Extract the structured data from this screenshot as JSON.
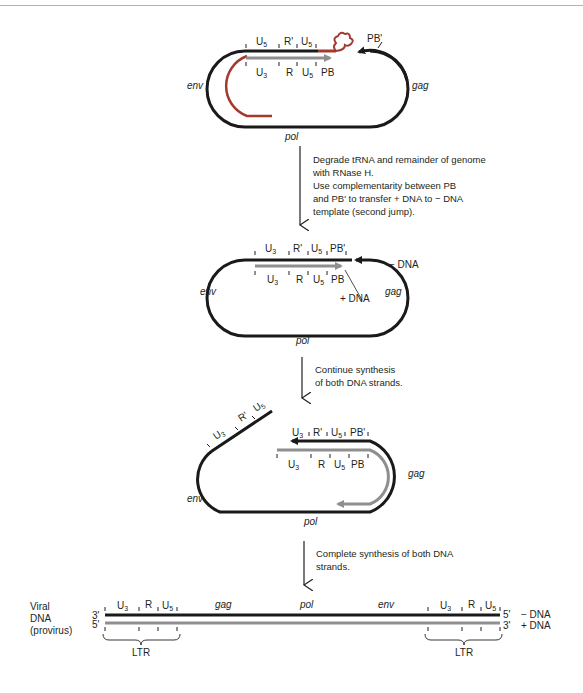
{
  "figure": {
    "colors": {
      "minus_dna": "#1a1a1a",
      "plus_dna": "#8f8f8f",
      "rna_trna": "#a33a2e",
      "header_rule": "#c9a9ae"
    },
    "panel1": {
      "top_labels": [
        "U",
        "R'",
        "U"
      ],
      "top_subs": [
        "5",
        "",
        "5"
      ],
      "bottom_labels": [
        "U",
        "R",
        "U",
        "PB"
      ],
      "bottom_subs": [
        "3",
        "",
        "5",
        ""
      ],
      "pb_prime": "PB'",
      "env": "env",
      "gag": "gag",
      "pol": "pol"
    },
    "step1": {
      "lines": [
        "Degrade tRNA and remainder of genome",
        "with RNase H.",
        "Use complementarity between PB",
        "and PB' to transfer  + DNA to  − DNA",
        "template (second jump)."
      ]
    },
    "panel2": {
      "top_labels": [
        "U",
        "R'",
        "U",
        "PB'"
      ],
      "top_subs": [
        "3",
        "",
        "5",
        ""
      ],
      "bottom_labels": [
        "U",
        "R",
        "U",
        "PB"
      ],
      "bottom_subs": [
        "3",
        "",
        "5",
        ""
      ],
      "minus_dna": "− DNA",
      "plus_dna": "+ DNA",
      "env": "env",
      "gag": "gag",
      "pol": "pol"
    },
    "step2": {
      "lines": [
        "Continue synthesis",
        "of both DNA strands."
      ]
    },
    "panel3": {
      "diag_labels": [
        "U",
        "R'",
        "U"
      ],
      "diag_subs": [
        "3",
        "",
        "5"
      ],
      "top_labels": [
        "U",
        "R'",
        "U",
        "PB'"
      ],
      "top_subs": [
        "3",
        "",
        "5",
        ""
      ],
      "bottom_labels": [
        "U",
        "R",
        "U",
        "PB"
      ],
      "bottom_subs": [
        "3",
        "",
        "5",
        ""
      ],
      "env": "env",
      "gag": "gag",
      "pol": "pol"
    },
    "step3": {
      "lines": [
        "Complete synthesis of both DNA",
        "strands."
      ]
    },
    "panel4": {
      "side_label": [
        "Viral",
        "DNA",
        "(provirus)"
      ],
      "left_ends": [
        "3'",
        "5'"
      ],
      "right_ends": [
        "5'",
        "3'"
      ],
      "strand_labels": [
        "− DNA",
        "+ DNA"
      ],
      "ltr_left": [
        "U",
        "R",
        "U"
      ],
      "ltr_subs": [
        "3",
        "",
        "5"
      ],
      "genes": [
        "gag",
        "pol",
        "env"
      ],
      "ltr_label": "LTR"
    }
  }
}
